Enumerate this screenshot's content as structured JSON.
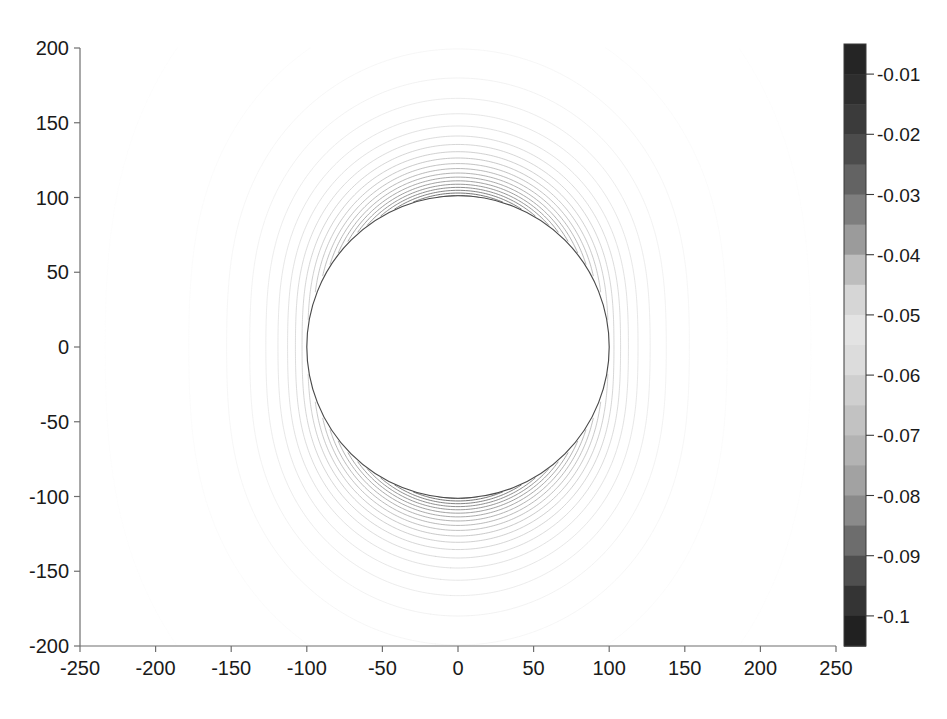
{
  "figure": {
    "kind": "contour-plot",
    "background_color": "#ffffff",
    "plot_area": {
      "left_px": 80,
      "top_px": 48,
      "right_px": 836,
      "bottom_px": 646
    }
  },
  "chart_data": {
    "type": "line",
    "render": "contour",
    "title": "",
    "subtitle": "",
    "xlabel": "",
    "ylabel": "",
    "grid": false,
    "legend": false,
    "legend_position": "none",
    "xlim": [
      -250,
      250
    ],
    "ylim": [
      -200,
      200
    ],
    "xticks": [
      -250,
      -200,
      -150,
      -100,
      -50,
      0,
      50,
      100,
      150,
      200,
      250
    ],
    "xtick_labels": [
      "-250",
      "-200",
      "-150",
      "-100",
      "-50",
      "0",
      "50",
      "100",
      "150",
      "200",
      "250"
    ],
    "yticks": [
      -200,
      -150,
      -100,
      -50,
      0,
      50,
      100,
      150,
      200
    ],
    "ytick_labels": [
      "-200",
      "-150",
      "-100",
      "-50",
      "0",
      "50",
      "100",
      "150",
      "200"
    ],
    "contour_levels": [
      -0.005,
      -0.01,
      -0.015,
      -0.02,
      -0.025,
      -0.03,
      -0.035,
      -0.04,
      -0.045,
      -0.05,
      -0.055,
      -0.06,
      -0.065,
      -0.07,
      -0.075,
      -0.08,
      -0.085,
      -0.09,
      -0.095,
      -0.1,
      -0.105
    ],
    "value_range": [
      -0.105,
      -0.005
    ],
    "masked_region": {
      "shape": "circle",
      "center": [
        0,
        0
      ],
      "radius": 100,
      "fill": "#ffffff",
      "outline_color": "#4a4a4a"
    },
    "field_description": "axisymmetric dipole-like potential field around a circular body of radius 100; contours densest near the poles (top and bottom of the circle) and form nested lobes to the left and right",
    "colorbar": {
      "orientation": "vertical",
      "position": "right",
      "ticks": [
        -0.01,
        -0.02,
        -0.03,
        -0.04,
        -0.05,
        -0.06,
        -0.07,
        -0.08,
        -0.09,
        -0.1
      ],
      "tick_labels": [
        "-0.01",
        "-0.02",
        "-0.03",
        "-0.04",
        "-0.05",
        "-0.06",
        "-0.07",
        "-0.08",
        "-0.09",
        "-0.1"
      ],
      "limits": [
        -0.105,
        -0.005
      ],
      "colormap": "grayscale-nonmonotonic",
      "swatch_colors": [
        "#252525",
        "#2e2e2e",
        "#3b3b3b",
        "#4c4c4c",
        "#636363",
        "#7e7e7e",
        "#9b9b9b",
        "#bdbdbd",
        "#d6d6d6",
        "#e3e3e3",
        "#dcdcdc",
        "#cfcfcf",
        "#c2c2c2",
        "#b3b3b3",
        "#a2a2a2",
        "#8a8a8a",
        "#6d6d6d",
        "#4f4f4f",
        "#343434",
        "#212121"
      ]
    }
  }
}
